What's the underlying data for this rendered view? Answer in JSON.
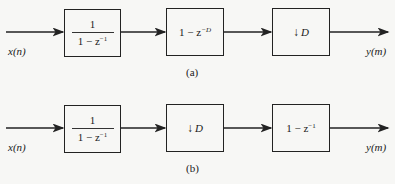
{
  "diagram_a": {
    "input_label": "x(n)",
    "output_label": "y(m)",
    "caption": "(a)",
    "blocks": [
      {
        "type": "fraction",
        "numerator": "1",
        "denominator_main": "1 − z",
        "denominator_exp": "−1"
      },
      {
        "type": "expression",
        "main": "1 − z",
        "exp": "−D"
      },
      {
        "type": "downsampler",
        "arrow": "↓",
        "factor": "D"
      }
    ]
  },
  "diagram_b": {
    "input_label": "x(n)",
    "output_label": "y(m)",
    "caption": "(b)",
    "blocks": [
      {
        "type": "fraction",
        "numerator": "1",
        "denominator_main": "1 − z",
        "denominator_exp": "−1"
      },
      {
        "type": "downsampler",
        "arrow": "↓",
        "factor": "D"
      },
      {
        "type": "expression",
        "main": "1 − z",
        "exp": "−1"
      }
    ]
  }
}
